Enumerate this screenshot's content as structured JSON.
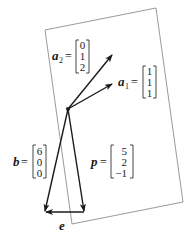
{
  "diagram": {
    "type": "projection-onto-plane",
    "plane": {
      "corners": [
        [
          45,
          30
        ],
        [
          156,
          8
        ],
        [
          183,
          202
        ],
        [
          72,
          224
        ]
      ],
      "stroke": "#808080"
    },
    "origin": [
      68,
      109
    ],
    "vectors": {
      "a1": {
        "name": "a",
        "subscript": "1",
        "components": [
          "1",
          "1",
          "1"
        ],
        "tip": [
          112,
          84
        ]
      },
      "a2": {
        "name": "a",
        "subscript": "2",
        "components": [
          "0",
          "1",
          "2"
        ],
        "tip": [
          112,
          55
        ]
      },
      "b": {
        "name": "b",
        "components": [
          "6",
          "0",
          "0"
        ],
        "tip": [
          45,
          212
        ]
      },
      "p": {
        "name": "p",
        "components": [
          "5",
          "2",
          "−1"
        ],
        "tip": [
          84,
          212
        ]
      },
      "e": {
        "name": "e",
        "from": [
          84,
          212
        ],
        "to": [
          45,
          212
        ]
      }
    },
    "equals": "=",
    "stroke_color": "#1a1a1a"
  }
}
